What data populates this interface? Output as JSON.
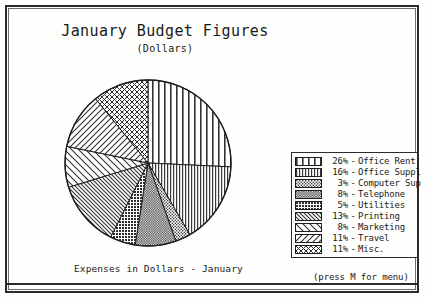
{
  "window": {
    "title": "January Budget Figures",
    "subtitle": "(Dollars)",
    "caption": "Expenses in Dollars - January",
    "menu_hint": "(press M for menu)"
  },
  "colors": {
    "ink": "#1a1a1a",
    "frame": "#2b2b2b",
    "paper": "#fefefc"
  },
  "chart_data": {
    "type": "pie",
    "title": "January Budget Figures",
    "subtitle": "(Dollars)",
    "xlabel": "",
    "ylabel": "",
    "units": "percent",
    "legend_position": "right",
    "grid": false,
    "start_angle_deg": -90,
    "direction": "clockwise",
    "categories": [
      "Office Rent",
      "Office Suppl",
      "Computer Sup",
      "Telephone",
      "Utilities",
      "Printing",
      "Marketing",
      "Travel",
      "Misc."
    ],
    "values": [
      26,
      16,
      3,
      8,
      5,
      13,
      8,
      11,
      11
    ],
    "labels": [
      "26% - Office Rent",
      "16% - Office Suppl",
      "3% - Computer Sup",
      "8% - Telephone",
      "5% - Utilities",
      "13% - Printing",
      "8% - Marketing",
      "11% - Travel",
      "11% - Misc."
    ],
    "slices": [
      {
        "label": "Office Rent",
        "percent": 26,
        "percent_text": "26%",
        "pattern": "vertical-lines-wide"
      },
      {
        "label": "Office Suppl",
        "percent": 16,
        "percent_text": "16%",
        "pattern": "vertical-lines-dense"
      },
      {
        "label": "Computer Sup",
        "percent": 3,
        "percent_text": "3%",
        "pattern": "stipple-dots"
      },
      {
        "label": "Telephone",
        "percent": 8,
        "percent_text": "8%",
        "pattern": "stipple-dense"
      },
      {
        "label": "Utilities",
        "percent": 5,
        "percent_text": "5%",
        "pattern": "crosshatch-dots"
      },
      {
        "label": "Printing",
        "percent": 13,
        "percent_text": "13%",
        "pattern": "backslash-dense"
      },
      {
        "label": "Marketing",
        "percent": 8,
        "percent_text": "8%",
        "pattern": "backslash-wide"
      },
      {
        "label": "Travel",
        "percent": 11,
        "percent_text": "11%",
        "pattern": "forwardslash"
      },
      {
        "label": "Misc.",
        "percent": 11,
        "percent_text": "11%",
        "pattern": "crosshatch-x"
      }
    ]
  },
  "legend": {
    "rows": [
      {
        "percent": "26%",
        "dash": "-",
        "label": "Office Rent",
        "pattern": "vertical-lines-wide"
      },
      {
        "percent": "16%",
        "dash": "-",
        "label": "Office Suppl",
        "pattern": "vertical-lines-dense"
      },
      {
        "percent": "3%",
        "dash": "-",
        "label": "Computer Sup",
        "pattern": "stipple-dots"
      },
      {
        "percent": "8%",
        "dash": "-",
        "label": "Telephone",
        "pattern": "stipple-dense"
      },
      {
        "percent": "5%",
        "dash": "-",
        "label": "Utilities",
        "pattern": "crosshatch-dots"
      },
      {
        "percent": "13%",
        "dash": "-",
        "label": "Printing",
        "pattern": "backslash-dense"
      },
      {
        "percent": "8%",
        "dash": "-",
        "label": "Marketing",
        "pattern": "backslash-wide"
      },
      {
        "percent": "11%",
        "dash": "-",
        "label": "Travel",
        "pattern": "forwardslash"
      },
      {
        "percent": "11%",
        "dash": "-",
        "label": "Misc.",
        "pattern": "crosshatch-x"
      }
    ]
  }
}
